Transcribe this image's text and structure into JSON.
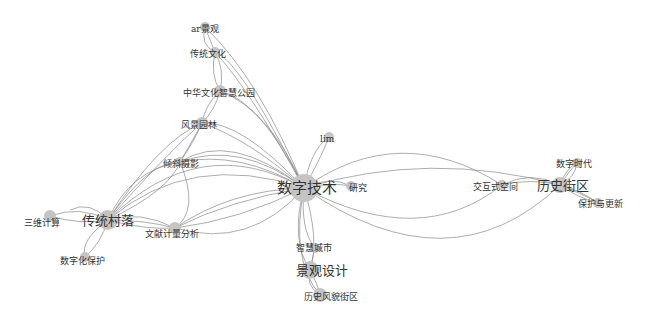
{
  "colors": {
    "node": "#c4c4c4",
    "edge": "#8a8a8a",
    "label": "#333333"
  },
  "nodes": [
    {
      "id": "shuzijishu",
      "label": "数字技术",
      "x": 304,
      "y": 188,
      "r": 14,
      "size": 15,
      "lx": 277,
      "ly": 193
    },
    {
      "id": "chuantongcunluo",
      "label": "传统村落",
      "x": 108,
      "y": 220,
      "r": 10,
      "size": 13,
      "lx": 82,
      "ly": 225
    },
    {
      "id": "lishijiequ",
      "label": "历史街区",
      "x": 560,
      "y": 185,
      "r": 8,
      "size": 13,
      "lx": 537,
      "ly": 190
    },
    {
      "id": "jingguansheji",
      "label": "景观设计",
      "x": 310,
      "y": 270,
      "r": 9,
      "size": 13,
      "lx": 296,
      "ly": 275
    },
    {
      "id": "arjingguan",
      "label": "ar景观",
      "x": 205,
      "y": 27,
      "r": 5,
      "size": 9,
      "lx": 191,
      "ly": 32
    },
    {
      "id": "chuantongwenhua",
      "label": "传统文化",
      "x": 215,
      "y": 52,
      "r": 5,
      "size": 9,
      "lx": 190,
      "ly": 57
    },
    {
      "id": "zhonghuawenhua",
      "label": "中华文化智慧公园",
      "x": 220,
      "y": 91,
      "r": 6,
      "size": 9,
      "lx": 183,
      "ly": 96
    },
    {
      "id": "fengjingyuanlin",
      "label": "风景园林",
      "x": 202,
      "y": 123,
      "r": 6,
      "size": 9,
      "lx": 181,
      "ly": 128
    },
    {
      "id": "qingxiesheying",
      "label": "倾斜摄影",
      "x": 180,
      "y": 162,
      "r": 5,
      "size": 9,
      "lx": 163,
      "ly": 167
    },
    {
      "id": "lim",
      "label": "lim",
      "x": 329,
      "y": 137,
      "r": 5,
      "size": 9,
      "lx": 320,
      "ly": 142
    },
    {
      "id": "yanjiu",
      "label": "研究",
      "x": 351,
      "y": 186,
      "r": 5,
      "size": 9,
      "lx": 349,
      "ly": 191
    },
    {
      "id": "sanweijisuan",
      "label": "三维计算",
      "x": 50,
      "y": 216,
      "r": 6,
      "size": 9,
      "lx": 24,
      "ly": 226
    },
    {
      "id": "wenxianjiliang",
      "label": "文献计量分析",
      "x": 175,
      "y": 228,
      "r": 6,
      "size": 9,
      "lx": 145,
      "ly": 237
    },
    {
      "id": "shuzihuabaohu",
      "label": "数字化保护",
      "x": 85,
      "y": 257,
      "r": 5,
      "size": 9,
      "lx": 60,
      "ly": 264
    },
    {
      "id": "zhihuichengshi",
      "label": "智慧城市",
      "x": 315,
      "y": 248,
      "r": 5,
      "size": 9,
      "lx": 296,
      "ly": 251
    },
    {
      "id": "lishifengmao",
      "label": "历史风貌街区",
      "x": 320,
      "y": 295,
      "r": 7,
      "size": 9,
      "lx": 304,
      "ly": 300
    },
    {
      "id": "jiaohushikongjian",
      "label": "交互式空间",
      "x": 502,
      "y": 185,
      "r": 5,
      "size": 9,
      "lx": 473,
      "ly": 190
    },
    {
      "id": "shuzishidai",
      "label": "数字时代",
      "x": 577,
      "y": 163,
      "r": 5,
      "size": 9,
      "lx": 556,
      "ly": 167
    },
    {
      "id": "baohuyugengxin",
      "label": "保护与更新",
      "x": 598,
      "y": 203,
      "r": 5,
      "size": 9,
      "lx": 578,
      "ly": 207
    }
  ],
  "edges": [
    {
      "d": "M304,188 Q260,80 205,27"
    },
    {
      "d": "M304,188 Q250,90 215,52"
    },
    {
      "d": "M304,188 Q240,60 215,52"
    },
    {
      "d": "M304,188 Q270,110 220,91"
    },
    {
      "d": "M304,188 Q260,100 220,91"
    },
    {
      "d": "M304,188 Q250,140 202,123"
    },
    {
      "d": "M304,188 Q240,120 202,123"
    },
    {
      "d": "M304,188 Q240,140 180,162"
    },
    {
      "d": "M304,188 Q230,130 180,162"
    },
    {
      "d": "M304,188 Q310,150 329,137"
    },
    {
      "d": "M304,188 Q320,160 329,137"
    },
    {
      "d": "M304,188 Q330,175 351,186"
    },
    {
      "d": "M304,188 Q330,182 351,186"
    },
    {
      "d": "M304,188 Q200,130 108,220"
    },
    {
      "d": "M304,188 Q190,150 108,220"
    },
    {
      "d": "M304,188 Q230,200 175,228"
    },
    {
      "d": "M304,188 Q240,220 175,228"
    },
    {
      "d": "M304,188 Q300,230 315,248"
    },
    {
      "d": "M304,188 Q290,240 310,270"
    },
    {
      "d": "M304,188 Q320,240 310,270"
    },
    {
      "d": "M304,188 Q290,260 320,295"
    },
    {
      "d": "M304,188 Q400,120 502,185"
    },
    {
      "d": "M304,188 Q420,250 502,185"
    },
    {
      "d": "M304,188 Q430,150 560,185"
    },
    {
      "d": "M304,188 Q450,290 560,185"
    },
    {
      "d": "M502,185 Q530,170 560,185"
    },
    {
      "d": "M502,185 Q530,178 560,185"
    },
    {
      "d": "M560,185 Q570,170 577,163"
    },
    {
      "d": "M560,185 Q566,168 577,163"
    },
    {
      "d": "M560,185 Q575,178 577,163"
    },
    {
      "d": "M560,185 Q580,190 598,203"
    },
    {
      "d": "M560,185 Q585,195 598,203"
    },
    {
      "d": "M560,185 Q578,198 598,203"
    },
    {
      "d": "M108,220 Q150,160 180,162"
    },
    {
      "d": "M108,220 Q130,170 180,162"
    },
    {
      "d": "M108,220 Q170,150 202,123"
    },
    {
      "d": "M108,220 Q160,140 202,123"
    },
    {
      "d": "M108,220 Q140,210 175,228"
    },
    {
      "d": "M108,220 Q145,220 175,228"
    },
    {
      "d": "M108,220 Q145,230 175,228"
    },
    {
      "d": "M108,220 Q80,205 50,216"
    },
    {
      "d": "M108,220 Q80,225 50,216"
    },
    {
      "d": "M108,220 Q90,200 70,210"
    },
    {
      "d": "M108,220 Q80,240 85,257"
    },
    {
      "d": "M108,220 Q100,245 85,257"
    },
    {
      "d": "M175,228 Q230,190 304,188"
    },
    {
      "d": "M175,228 Q250,250 304,188"
    },
    {
      "d": "M180,162 Q240,150 304,188"
    },
    {
      "d": "M205,27 Q210,40 215,52"
    },
    {
      "d": "M205,27 Q200,45 215,52"
    },
    {
      "d": "M215,52 Q210,75 220,91"
    },
    {
      "d": "M215,52 Q225,70 220,91"
    },
    {
      "d": "M220,91 Q205,105 202,123"
    },
    {
      "d": "M220,91 Q215,110 202,123"
    },
    {
      "d": "M202,123 Q190,145 180,162"
    },
    {
      "d": "M202,123 Q195,140 180,162"
    },
    {
      "d": "M180,162 Q170,190 108,220"
    },
    {
      "d": "M180,162 Q200,210 175,228"
    },
    {
      "d": "M310,270 Q312,260 315,248"
    },
    {
      "d": "M310,270 Q318,285 320,295"
    },
    {
      "d": "M310,270 Q305,285 320,295"
    }
  ]
}
